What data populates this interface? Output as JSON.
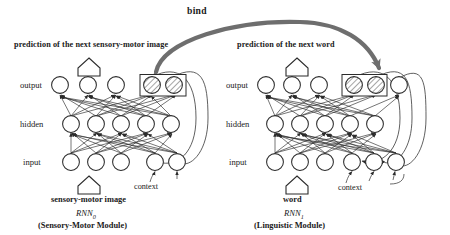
{
  "diagram": {
    "bind_label": "bind",
    "modules": [
      {
        "id": "sensory-motor",
        "prediction_label": "prediction of the next sensory-motor image",
        "input_label": "sensory-motor image",
        "rnn_name": "RNN",
        "rnn_subscript": "0",
        "module_name": "(Sensory-Motor Module)",
        "context_label": "context",
        "layers": [
          {
            "name": "output",
            "label": "output",
            "plain_nodes": 3,
            "hatched_nodes": 2,
            "trailing_nodes": 0
          },
          {
            "name": "hidden",
            "label": "hidden",
            "plain_nodes": 5,
            "hatched_nodes": 0,
            "trailing_nodes": 0
          },
          {
            "name": "input",
            "label": "input",
            "plain_nodes": 3,
            "context_nodes": 2
          }
        ],
        "recurrent_loops": 2
      },
      {
        "id": "linguistic",
        "prediction_label": "prediction of the next word",
        "input_label": "word",
        "rnn_name": "RNN",
        "rnn_subscript": "1",
        "module_name": "(Linguistic Module)",
        "context_label": "context",
        "layers": [
          {
            "name": "output",
            "label": "output",
            "plain_nodes": 3,
            "hatched_nodes": 2,
            "trailing_nodes": 1
          },
          {
            "name": "hidden",
            "label": "hidden",
            "plain_nodes": 5,
            "hatched_nodes": 0,
            "trailing_nodes": 0
          },
          {
            "name": "input",
            "label": "input",
            "plain_nodes": 3,
            "context_nodes": 3
          }
        ],
        "recurrent_loops": 3
      }
    ],
    "axis_labels": [
      "output",
      "hidden",
      "input"
    ],
    "colors": {
      "stroke": "#2b2b2b",
      "bind_arrow": "#6e6e6e",
      "node_fill": "#ffffff",
      "hatch": "#555555",
      "text": "#1a1a1a"
    },
    "icons": {
      "prediction_arrow": "up-arrow-pentagon-icon",
      "input_arrow": "up-arrow-pentagon-icon",
      "bind_arrow": "bidirectional-curved-arrow-icon"
    }
  }
}
